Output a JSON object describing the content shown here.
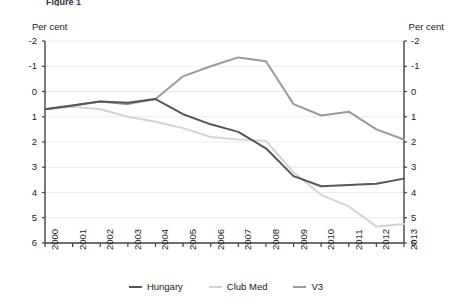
{
  "figure": {
    "title": "Figure 1",
    "left_axis_unit": "Per cent",
    "right_axis_unit": "Per cent"
  },
  "legend": {
    "position": "bottom-center",
    "items": [
      {
        "label": "Hungary",
        "color": "#575757"
      },
      {
        "label": "Club Med",
        "color": "#d4d4d4"
      },
      {
        "label": "V3",
        "color": "#9a9a9a"
      }
    ]
  },
  "chart_data": {
    "type": "line",
    "title": "Figure 1",
    "xlabel": "",
    "ylabel": "Per cent",
    "ylim": [
      -2,
      6
    ],
    "yticks": [
      -2,
      -1,
      0,
      1,
      2,
      3,
      4,
      5,
      6
    ],
    "xticks": [
      "2000",
      "2001",
      "2002",
      "2003",
      "2004",
      "2005",
      "2006",
      "2007",
      "2008",
      "2009",
      "2010",
      "2011",
      "2012",
      "2013"
    ],
    "grid": true,
    "dual_axis": true,
    "categories": [
      "2000",
      "2001",
      "2002",
      "2003",
      "2004",
      "2005",
      "2006",
      "2007",
      "2008",
      "2009",
      "2010",
      "2011",
      "2012",
      "2013"
    ],
    "series": [
      {
        "name": "Hungary",
        "color": "#575757",
        "values": [
          3.3,
          3.45,
          3.6,
          3.55,
          3.7,
          3.1,
          2.7,
          2.4,
          1.75,
          0.65,
          0.25,
          0.3,
          0.35,
          0.55
        ]
      },
      {
        "name": "Club Med",
        "color": "#d4d4d4",
        "values": [
          3.3,
          3.4,
          3.3,
          3.0,
          2.8,
          2.55,
          2.2,
          2.1,
          2.05,
          0.8,
          -0.1,
          -0.55,
          -1.35,
          -1.25
        ]
      },
      {
        "name": "V3",
        "color": "#9a9a9a",
        "values": [
          3.3,
          3.45,
          3.6,
          3.5,
          3.7,
          4.6,
          5.0,
          5.35,
          5.2,
          3.5,
          3.05,
          3.2,
          2.5,
          2.1
        ]
      }
    ]
  },
  "axis_labels": {
    "y_left": [
      "6",
      "5",
      "4",
      "3",
      "2",
      "1",
      "0",
      "-1",
      "-2"
    ],
    "y_right": [
      "6",
      "5",
      "4",
      "3",
      "2",
      "1",
      "0",
      "-1",
      "-2"
    ]
  },
  "colors": {
    "axis": "#444444",
    "grid": "#ececec",
    "text": "#1a1a1a"
  }
}
